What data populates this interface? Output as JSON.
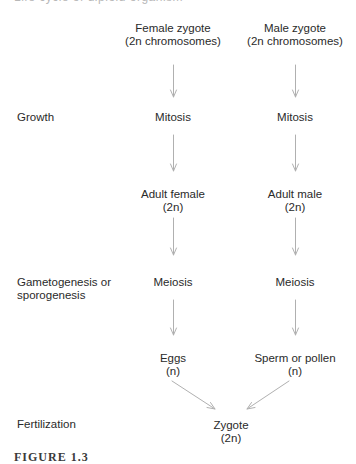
{
  "header": {
    "cut_text": "Life cycle of diploid organism"
  },
  "stages": {
    "growth": "Growth",
    "gametogenesis_line1": "Gametogenesis or",
    "gametogenesis_line2": "sporogenesis",
    "fertilization": "Fertilization"
  },
  "female": {
    "zygote": {
      "line1": "Female zygote",
      "line2": "(2n chromosomes)"
    },
    "mitosis": "Mitosis",
    "adult": {
      "line1": "Adult female",
      "line2": "(2n)"
    },
    "meiosis": "Meiosis",
    "gamete": {
      "line1": "Eggs",
      "line2": "(n)"
    }
  },
  "male": {
    "zygote": {
      "line1": "Male zygote",
      "line2": "(2n chromosomes)"
    },
    "mitosis": "Mitosis",
    "adult": {
      "line1": "Adult male",
      "line2": "(2n)"
    },
    "meiosis": "Meiosis",
    "gamete": {
      "line1": "Sperm or pollen",
      "line2": "(n)"
    }
  },
  "offspring": {
    "line1": "Zygote",
    "line2": "(2n)"
  },
  "caption": {
    "text": "FIGURE 1.3"
  },
  "colors": {
    "text": "#2a2a2a",
    "arrow": "#b0b0b0"
  }
}
